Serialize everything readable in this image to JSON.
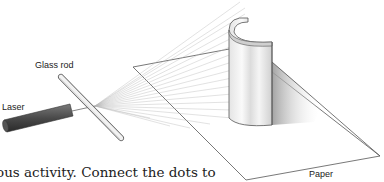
{
  "diagram": {
    "labels": {
      "glass_rod": "Glass rod",
      "laser": "Laser",
      "paper": "Paper"
    },
    "colors": {
      "laser_body": "#4a4a4a",
      "lines": "#555555",
      "fan_lines": "#b0b0b0"
    }
  },
  "text": {
    "body_fragment": "ous activity. Connect the dots to"
  }
}
